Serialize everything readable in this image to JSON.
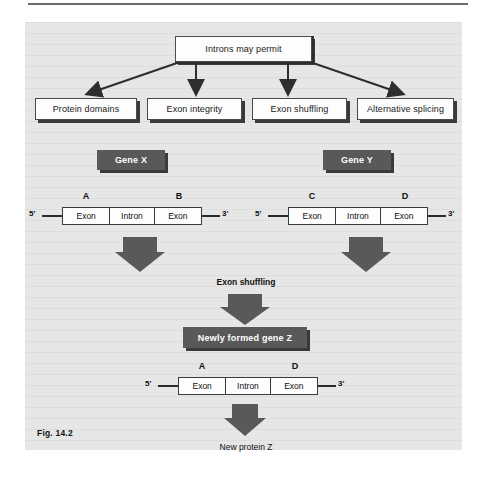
{
  "figure": {
    "label": "Fig. 14.2",
    "root_box": "Introns may permit",
    "branches": [
      "Protein domains",
      "Exon integrity",
      "Exon shuffling",
      "Alternative splicing"
    ],
    "gene_x": {
      "title": "Gene X",
      "five_prime": "5'",
      "three_prime": "3'",
      "segments": [
        "Exon",
        "Intron",
        "Exon"
      ],
      "exon_tags": [
        "A",
        "B"
      ]
    },
    "gene_y": {
      "title": "Gene Y",
      "five_prime": "5'",
      "three_prime": "3'",
      "segments": [
        "Exon",
        "Intron",
        "Exon"
      ],
      "exon_tags": [
        "C",
        "D"
      ]
    },
    "shuffling_label": "Exon shuffling",
    "gene_z_box": "Newly formed gene Z",
    "gene_z": {
      "five_prime": "5'",
      "three_prime": "3'",
      "segments": [
        "Exon",
        "Intron",
        "Exon"
      ],
      "exon_tags": [
        "A",
        "D"
      ]
    },
    "product": "New protein Z"
  },
  "colors": {
    "panel_background": "#e6e6e6",
    "dark_fill": "#595959",
    "shadow": "#3a3a3a",
    "line": "#2e2e2e",
    "box_fill": "#fdfdfd"
  }
}
